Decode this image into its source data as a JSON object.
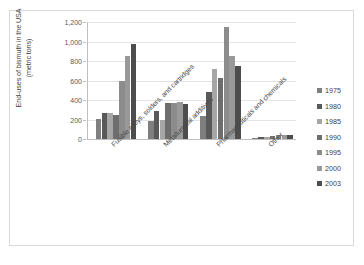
{
  "chart_data": {
    "type": "bar",
    "title": "",
    "xlabel": "",
    "ylabel": "End-uses of bismuth in the USA (metric tons)",
    "ylabel_line1": "End-uses of bismuth in the USA",
    "ylabel_line2": "(metric tons)",
    "ylim": [
      0,
      1200
    ],
    "grid": true,
    "legend_position": "right",
    "ytick_labels": [
      "1,200",
      "1,000",
      "800",
      "600",
      "400",
      "200",
      "0"
    ],
    "ytick_values": [
      1200,
      1000,
      800,
      600,
      400,
      200,
      0
    ],
    "categories": [
      "Fusible alloys, solders, and cartridges",
      "Metallurgical additives",
      "Pharmaceuticals and chemicals",
      "Other"
    ],
    "series": [
      {
        "name": "1975",
        "color": "#7f7f7f",
        "values": [
          210,
          185,
          240,
          10
        ]
      },
      {
        "name": "1980",
        "color": "#595959",
        "values": [
          265,
          285,
          480,
          20
        ]
      },
      {
        "name": "1985",
        "color": "#a6a6a6",
        "values": [
          270,
          190,
          715,
          25
        ]
      },
      {
        "name": "1990",
        "color": "#6e6e6e",
        "values": [
          250,
          370,
          625,
          30
        ]
      },
      {
        "name": "1995",
        "color": "#8c8c8c",
        "values": [
          600,
          370,
          1145,
          40
        ]
      },
      {
        "name": "2000",
        "color": "#999999",
        "values": [
          850,
          375,
          855,
          45
        ]
      },
      {
        "name": "2003",
        "color": "#4d4d4d",
        "values": [
          975,
          360,
          750,
          45
        ]
      }
    ]
  },
  "legend": {
    "items": [
      {
        "label": "1975",
        "color": "#7f7f7f"
      },
      {
        "label": "1980",
        "color": "#595959"
      },
      {
        "label": "1985",
        "color": "#a6a6a6"
      },
      {
        "label": "1990",
        "color": "#6e6e6e"
      },
      {
        "label": "1995",
        "color": "#8c8c8c"
      },
      {
        "label": "2000",
        "color": "#999999"
      },
      {
        "label": "2003",
        "color": "#4d4d4d"
      }
    ]
  }
}
